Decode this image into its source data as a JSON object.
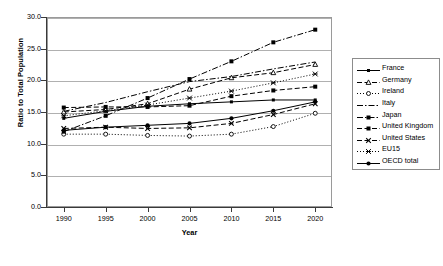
{
  "chart_data": {
    "type": "line",
    "title": "",
    "xlabel": "Year",
    "ylabel": "Ratio to Total Population",
    "x": [
      1990,
      1995,
      2000,
      2005,
      2010,
      2015,
      2020
    ],
    "xlim": [
      1988,
      2022
    ],
    "ylim": [
      0.0,
      30.0
    ],
    "yticks": [
      "0.0",
      "5.0",
      "10.0",
      "15.0",
      "20.0",
      "25.0",
      "30.0"
    ],
    "xticks": [
      "1990",
      "1995",
      "2000",
      "2005",
      "2010",
      "2015",
      "2020"
    ],
    "grid": "horizontal",
    "legend_position": "right",
    "series": [
      {
        "name": "France",
        "marker": "square-small",
        "dash": "solid",
        "values": [
          14.0,
          15.1,
          15.9,
          16.3,
          16.6,
          16.9,
          16.9
        ]
      },
      {
        "name": "Germany",
        "marker": "triangle",
        "dash": "dashed",
        "values": [
          15.0,
          15.4,
          16.3,
          18.6,
          20.4,
          21.2,
          22.5
        ]
      },
      {
        "name": "Ireland",
        "marker": "circle-open",
        "dash": "dotted",
        "values": [
          11.5,
          11.5,
          11.3,
          11.2,
          11.5,
          12.7,
          14.8
        ]
      },
      {
        "name": "Italy",
        "marker": "none",
        "dash": "dash-dot",
        "values": [
          15.1,
          16.5,
          18.2,
          19.8,
          20.6,
          21.8,
          22.9
        ]
      },
      {
        "name": "Japan",
        "marker": "square-filled",
        "dash": "dash-dot",
        "values": [
          11.9,
          14.4,
          17.2,
          20.2,
          23.0,
          26.0,
          28.0
        ]
      },
      {
        "name": "United Kingdom",
        "marker": "square-filled",
        "dash": "dashed",
        "values": [
          15.7,
          15.8,
          15.8,
          16.0,
          17.5,
          18.4,
          19.0
        ]
      },
      {
        "name": "United States",
        "marker": "x-cross",
        "dash": "dashed",
        "values": [
          12.4,
          12.6,
          12.4,
          12.5,
          13.2,
          14.6,
          16.3
        ]
      },
      {
        "name": "EU15",
        "marker": "asterisk",
        "dash": "dotted",
        "values": [
          14.4,
          15.2,
          16.1,
          17.2,
          18.3,
          19.6,
          21.0
        ]
      },
      {
        "name": "OECD total",
        "marker": "circle-filled",
        "dash": "solid",
        "values": [
          12.1,
          12.6,
          12.9,
          13.2,
          14.0,
          15.2,
          16.6
        ]
      }
    ]
  },
  "legend": {
    "items": [
      {
        "label": "France"
      },
      {
        "label": "Germany"
      },
      {
        "label": "Ireland"
      },
      {
        "label": "Italy"
      },
      {
        "label": "Japan"
      },
      {
        "label": "United Kingdom"
      },
      {
        "label": "United States"
      },
      {
        "label": "EU15"
      },
      {
        "label": "OECD total"
      }
    ]
  },
  "caption": {
    "text": ""
  },
  "colors": {
    "series": "#000000",
    "grid": "#b0b0b0",
    "axis": "#3a3a3a",
    "frame": "#9a9a9a",
    "background": "#ffffff"
  }
}
